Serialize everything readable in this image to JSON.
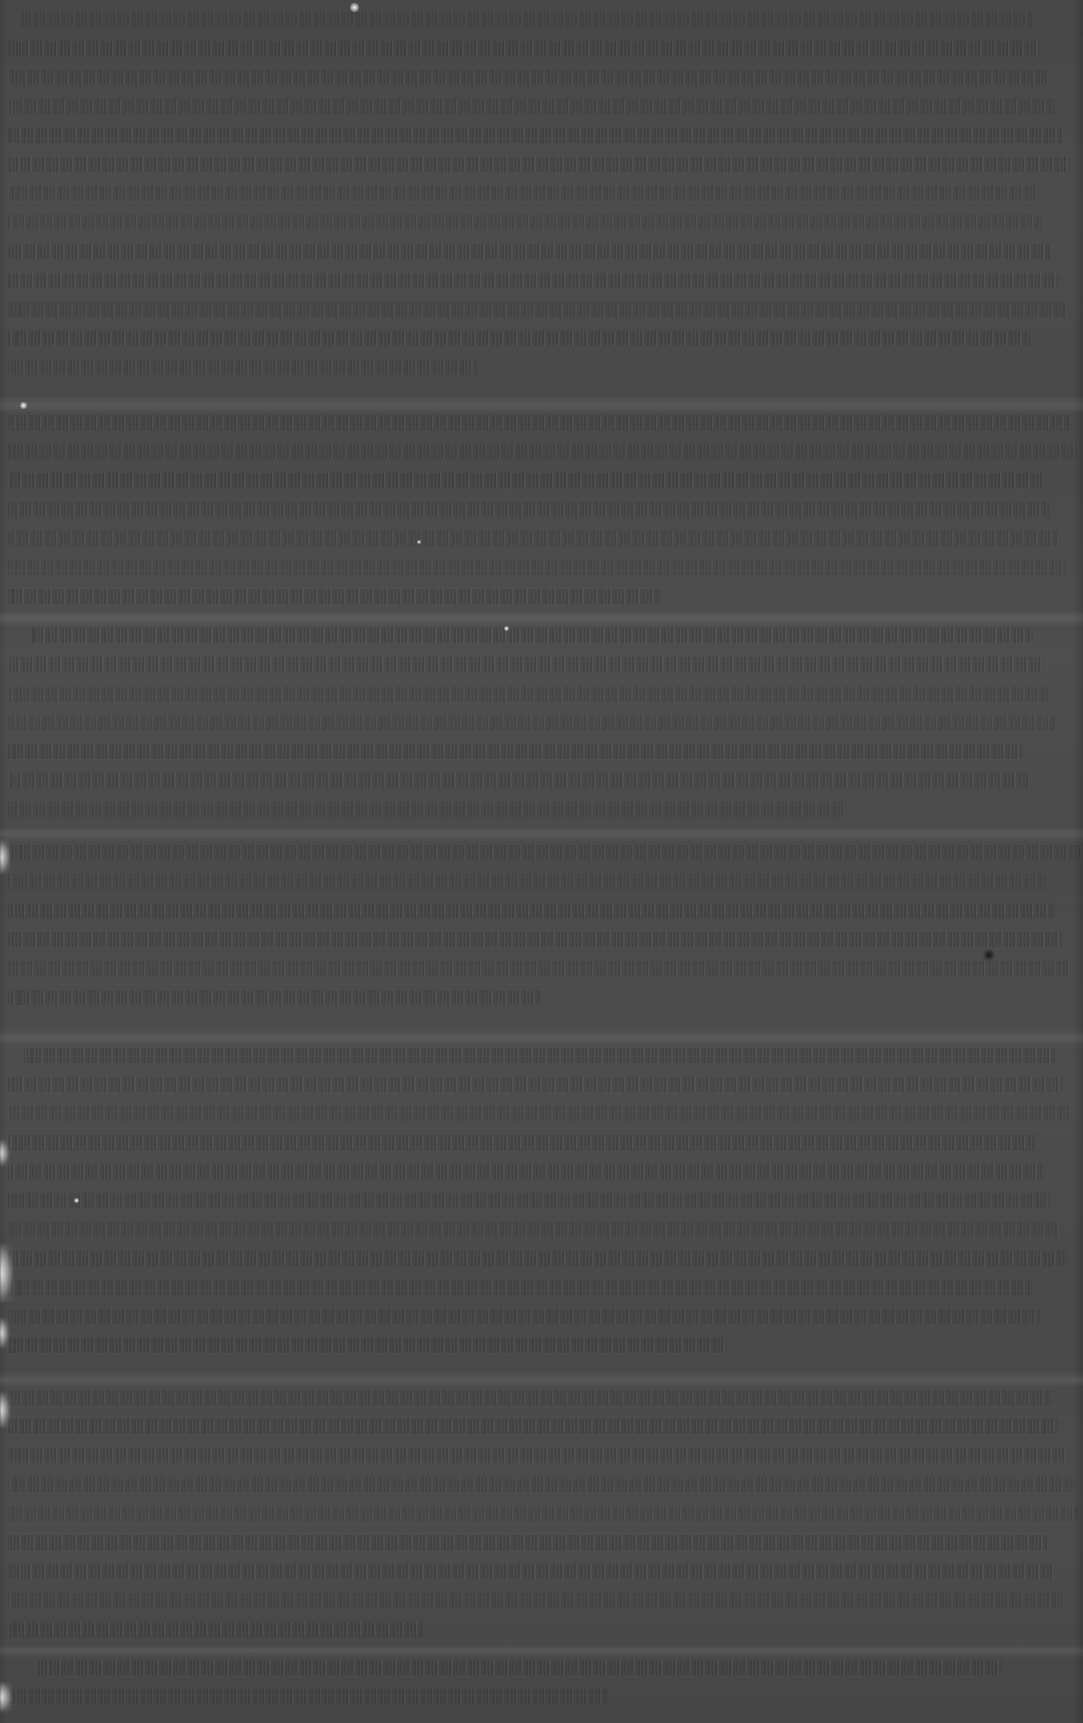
{
  "document": {
    "kind": "scanned-page",
    "legible_text": "",
    "condition_note": "",
    "width_px": 1083,
    "height_px": 1723
  },
  "colors": {
    "page_background": "#4a4a4a",
    "text_band": "#3a3a3a",
    "gap_band": "#565656",
    "edge_highlight": "#ffffff",
    "outer_background": "#2e2e2e"
  },
  "layout": {
    "content_left_px": 8,
    "content_right_px": 1075,
    "line_height_px": 29,
    "right_margin_px": 10,
    "left_margin_px": 8
  },
  "text_blocks": [
    {
      "top": 12,
      "lines": 13,
      "line_height": 29,
      "indent": 14,
      "width_pct": 98
    },
    {
      "top": 415,
      "lines": 7,
      "line_height": 29,
      "indent": 0,
      "width_pct": 99
    },
    {
      "top": 628,
      "lines": 7,
      "line_height": 29,
      "indent": 22,
      "width_pct": 97
    },
    {
      "top": 845,
      "lines": 6,
      "line_height": 29,
      "indent": 0,
      "width_pct": 99
    },
    {
      "top": 1048,
      "lines": 11,
      "line_height": 29,
      "indent": 16,
      "width_pct": 98
    },
    {
      "top": 1390,
      "lines": 9,
      "line_height": 29,
      "indent": 0,
      "width_pct": 99
    },
    {
      "top": 1660,
      "lines": 2,
      "line_height": 29,
      "indent": 30,
      "width_pct": 92
    }
  ],
  "gap_bands": [
    {
      "top": 396,
      "height": 18
    },
    {
      "top": 610,
      "height": 16
    },
    {
      "top": 826,
      "height": 16
    },
    {
      "top": 1030,
      "height": 16
    },
    {
      "top": 1372,
      "height": 16
    },
    {
      "top": 1644,
      "height": 14
    }
  ],
  "edge_artifacts": [
    {
      "top": 840,
      "height": 34,
      "width": 10
    },
    {
      "top": 1140,
      "height": 26,
      "width": 9
    },
    {
      "top": 1244,
      "height": 58,
      "width": 13
    },
    {
      "top": 1318,
      "height": 30,
      "width": 9
    },
    {
      "top": 1392,
      "height": 36,
      "width": 10
    },
    {
      "top": 1682,
      "height": 30,
      "width": 12
    }
  ],
  "bright_specks": [
    {
      "left": 350,
      "top": 3,
      "size": 9
    },
    {
      "left": 20,
      "top": 402,
      "size": 7
    },
    {
      "left": 504,
      "top": 626,
      "size": 5
    },
    {
      "left": 417,
      "top": 540,
      "size": 4
    },
    {
      "left": 74,
      "top": 1198,
      "size": 5
    }
  ],
  "dark_specks": [
    {
      "left": 984,
      "top": 950,
      "size": 10
    }
  ]
}
